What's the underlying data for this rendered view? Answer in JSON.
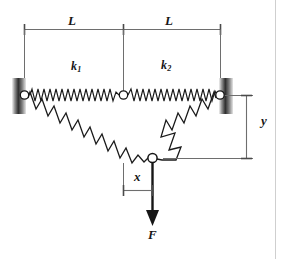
{
  "figure": {
    "labels": {
      "length_left": "L",
      "length_right": "L",
      "spring_1": "k",
      "spring_1_sub": "1",
      "spring_2": "k",
      "spring_2_sub": "2",
      "vertical_displacement": "y",
      "horizontal_displacement": "x",
      "force": "F"
    },
    "colors": {
      "line": "#161616",
      "dimension_line": "#6e6e6e",
      "support_dark": "#2b2b2b",
      "support_light": "#d9d9d9",
      "node_fill": "#ffffff",
      "background": "#ffffff",
      "page_edge": "#cfcfcf"
    },
    "geometry": {
      "left_support_pin": [
        24,
        95
      ],
      "right_support_pin": [
        220,
        95
      ],
      "center_node": [
        123,
        95
      ],
      "bottom_node": [
        152,
        158
      ],
      "force_arrow_tip": [
        152,
        224
      ],
      "dimension_top_y": 29,
      "dimension_y_right_x": 246,
      "dimension_x_baseline_y": 190
    }
  }
}
